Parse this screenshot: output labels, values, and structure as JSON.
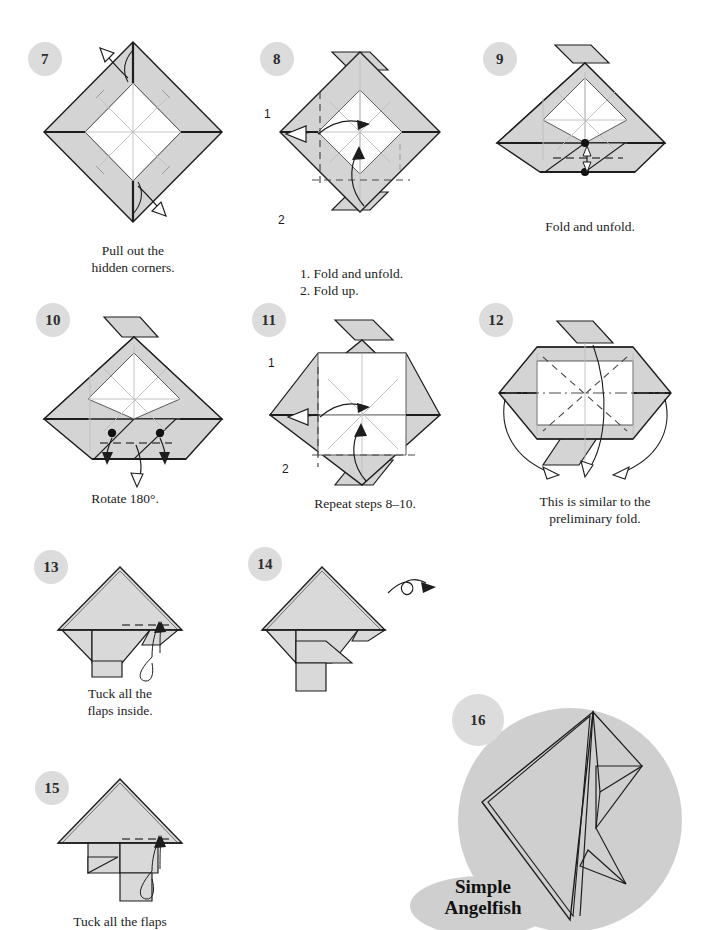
{
  "page": {
    "kind": "origami-instruction-diagram",
    "model_name_line1": "Simple",
    "model_name_line2": "Angelfish",
    "paper_fill": "#d4d4d4",
    "paper_fill_light": "#e2e2e2",
    "badge_fill": "#dcdcdc",
    "line_color": "#1d1d1d",
    "crease_color": "#b9b9b9",
    "highlight_circle": "#cfcfcf"
  },
  "steps": [
    {
      "number": "7",
      "caption": "Pull out the\nhidden corners.",
      "sub_labels": [],
      "figure": "diamond-frame-pullout"
    },
    {
      "number": "8",
      "caption": "1. Fold and unfold.\n2. Fold up.",
      "sub_labels": [
        "1",
        "2"
      ],
      "figure": "diamond-frame-flaps"
    },
    {
      "number": "9",
      "caption": "Fold and unfold.",
      "sub_labels": [],
      "figure": "pentagon-dots"
    },
    {
      "number": "10",
      "caption": "Rotate 180°.",
      "sub_labels": [],
      "figure": "pentagon-two-dots"
    },
    {
      "number": "11",
      "caption": "Repeat steps 8–10.",
      "sub_labels": [
        "1",
        "2"
      ],
      "figure": "diamond-frame-flaps-2"
    },
    {
      "number": "12",
      "caption": "This is similar to the\npreliminary fold.",
      "sub_labels": [],
      "figure": "hexagon-collapse"
    },
    {
      "number": "13",
      "caption": "Tuck all the\nflaps inside.",
      "sub_labels": [],
      "figure": "fish-body-tuck"
    },
    {
      "number": "14",
      "caption": "",
      "sub_labels": [],
      "figure": "fish-body-turnover"
    },
    {
      "number": "15",
      "caption": "Tuck all the flaps",
      "sub_labels": [],
      "figure": "fish-body-tuck-2"
    },
    {
      "number": "16",
      "caption": "",
      "sub_labels": [],
      "figure": "finished-angelfish"
    }
  ]
}
